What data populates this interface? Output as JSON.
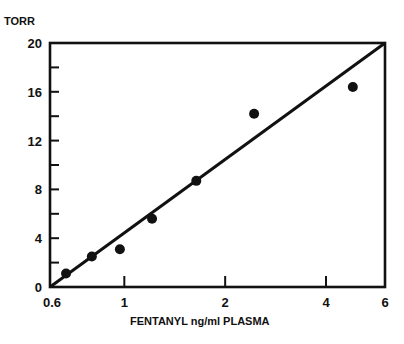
{
  "chart_data": {
    "type": "scatter",
    "title": "",
    "xlabel": "FENTANYL ng/ml PLASMA",
    "ylabel": "TORR",
    "xscale": "log",
    "xlim": [
      0.6,
      6
    ],
    "ylim": [
      0,
      20
    ],
    "grid": false,
    "legend": null,
    "x_ticks": [
      0.6,
      1,
      2,
      4,
      6
    ],
    "x_tick_labels": [
      "0.6",
      "1",
      "2",
      "4",
      "6"
    ],
    "y_ticks": [
      0,
      2,
      4,
      6,
      8,
      10,
      12,
      14,
      16,
      18,
      20
    ],
    "y_tick_labels": [
      "0",
      "4",
      "8",
      "12",
      "16",
      "20"
    ],
    "y_tick_label_values": [
      0,
      4,
      8,
      12,
      16,
      20
    ],
    "series": [
      {
        "name": "data",
        "type": "scatter",
        "x": [
          0.67,
          0.8,
          0.97,
          1.21,
          1.64,
          2.44,
          4.81
        ],
        "y": [
          1.1,
          2.5,
          3.1,
          5.6,
          8.7,
          14.2,
          16.4
        ]
      },
      {
        "name": "regression line",
        "type": "line",
        "x": [
          0.6,
          6
        ],
        "y": [
          0,
          20
        ]
      }
    ]
  },
  "labels": {
    "y_axis_title": "TORR",
    "x_axis_title": "FENTANYL ng/ml PLASMA"
  }
}
